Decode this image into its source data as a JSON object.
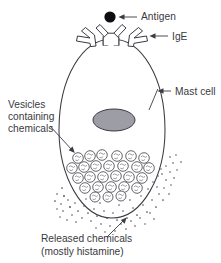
{
  "diagram": {
    "type": "biology-illustration",
    "background_color": "#ffffff",
    "ink_color": "#3b3b43",
    "text_color": "#3a3a42",
    "nucleus_fill": "#9d9da5",
    "antigen_fill": "#0d0d12"
  },
  "labels": {
    "antigen": "Antigen",
    "ige": "IgE",
    "mast_cell": "Mast cell",
    "vesicles_line1": "Vesicles",
    "vesicles_line2": "containing",
    "vesicles_line3": "chemicals",
    "released_line1": "Released chemicals",
    "released_line2": "(mostly histamine)"
  },
  "parts": {
    "antigen_name": "antigen-dot",
    "ige_name": "ige-receptor",
    "membrane_name": "cell-membrane",
    "nucleus_name": "cell-nucleus",
    "vesicle_name": "vesicle",
    "chemical_name": "released-chemical-dot"
  },
  "counts": {
    "ige_receptors": 3,
    "vesicles": 27,
    "antigens": 1
  },
  "geometry": {
    "canvas_width": 221,
    "canvas_height": 263,
    "cell_center_x": 112,
    "cell_center_y": 130,
    "cell_radius_x": 53,
    "cell_radius_y": 91,
    "nucleus_center_x": 114,
    "nucleus_center_y": 120,
    "nucleus_radius_x": 21,
    "nucleus_radius_y": 11,
    "antigen_center_x": 110,
    "antigen_center_y": 17,
    "antigen_radius": 5.6
  }
}
